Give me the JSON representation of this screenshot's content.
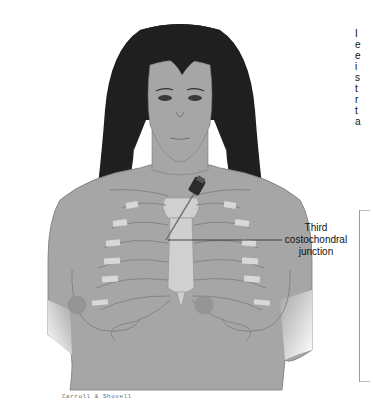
{
  "figure": {
    "annotation": {
      "line1": "Third",
      "line2": "costochondral",
      "line3": "junction"
    },
    "signature": "Carroll & Shovell",
    "side_text_fragments": [
      "I",
      "e",
      "e",
      "i",
      "s",
      "t",
      "r",
      "t",
      "a"
    ],
    "colors": {
      "skin": "#a6a6a6",
      "hair": "#1f1f1f",
      "outline": "#6b6b6b",
      "cartilage": "#d8d8d8",
      "bone": "#cfcfcf",
      "leader_line": "#333333"
    }
  }
}
